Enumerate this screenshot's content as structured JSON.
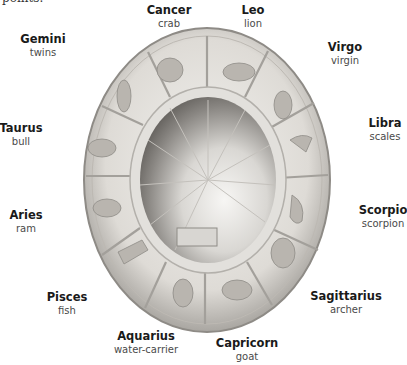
{
  "clipped_caption": "points.",
  "figure": {
    "object": "zodiac-relief-bowl",
    "colors": {
      "stone_light": "#e9e7e3",
      "stone_mid": "#c9c6c0",
      "stone_dark": "#8e8b86",
      "bowl_shadow": "#6e6b67",
      "text_name": "#1a1a1a",
      "text_meaning": "#4a4a4a"
    }
  },
  "signs": [
    {
      "name": "Cancer",
      "meaning": "crab",
      "x": 169,
      "y": 4
    },
    {
      "name": "Leo",
      "meaning": "lion",
      "x": 253,
      "y": 4
    },
    {
      "name": "Gemini",
      "meaning": "twins",
      "x": 43,
      "y": 33
    },
    {
      "name": "Virgo",
      "meaning": "virgin",
      "x": 345,
      "y": 41
    },
    {
      "name": "Libra",
      "meaning": "scales",
      "x": 385,
      "y": 117
    },
    {
      "name": "Taurus",
      "meaning": "bull",
      "x": 21,
      "y": 122
    },
    {
      "name": "Aries",
      "meaning": "ram",
      "x": 26,
      "y": 209
    },
    {
      "name": "Scorpio",
      "meaning": "scorpion",
      "x": 383,
      "y": 204
    },
    {
      "name": "Pisces",
      "meaning": "fish",
      "x": 67,
      "y": 291
    },
    {
      "name": "Sagittarius",
      "meaning": "archer",
      "x": 346,
      "y": 290
    },
    {
      "name": "Aquarius",
      "meaning": "water-carrier",
      "x": 146,
      "y": 330
    },
    {
      "name": "Capricorn",
      "meaning": "goat",
      "x": 247,
      "y": 337
    }
  ]
}
